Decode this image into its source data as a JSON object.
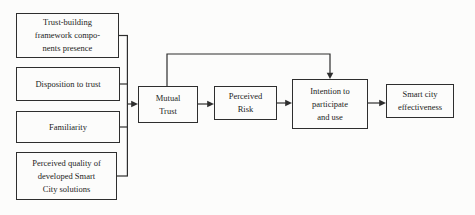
{
  "diagram_title": "trust-smart-city-model",
  "boxes": {
    "trust_building": {
      "lines": [
        "Trust-building",
        "framework compo-",
        "nents presence"
      ]
    },
    "disposition": {
      "lines": [
        "Disposition to trust"
      ]
    },
    "familiarity": {
      "lines": [
        "Familiarity"
      ]
    },
    "perceived_quality": {
      "lines": [
        "Perceived quality of",
        "developed Smart",
        "City solutions"
      ]
    },
    "mutual_trust": {
      "lines": [
        "Mutual",
        "Trust"
      ]
    },
    "perceived_risk": {
      "lines": [
        "Perceived",
        "Risk"
      ]
    },
    "intention": {
      "lines": [
        "Intention to",
        "participate",
        "and use"
      ]
    },
    "smart_city": {
      "lines": [
        "Smart city",
        "effectiveness"
      ]
    }
  },
  "edges": [
    {
      "from": "trust_building",
      "to": "mutual_trust",
      "via": "shared-bus"
    },
    {
      "from": "disposition",
      "to": "mutual_trust",
      "via": "shared-bus"
    },
    {
      "from": "familiarity",
      "to": "mutual_trust",
      "via": "shared-bus"
    },
    {
      "from": "perceived_quality",
      "to": "mutual_trust",
      "via": "shared-bus"
    },
    {
      "from": "mutual_trust",
      "to": "perceived_risk"
    },
    {
      "from": "perceived_risk",
      "to": "intention"
    },
    {
      "from": "mutual_trust",
      "to": "intention",
      "via": "top-bypass"
    },
    {
      "from": "intention",
      "to": "smart_city"
    }
  ],
  "colors": {
    "border": "#2e2e2e",
    "text": "#1c1c1c",
    "line": "#2e2e2e",
    "background": "#fcfcfb"
  }
}
